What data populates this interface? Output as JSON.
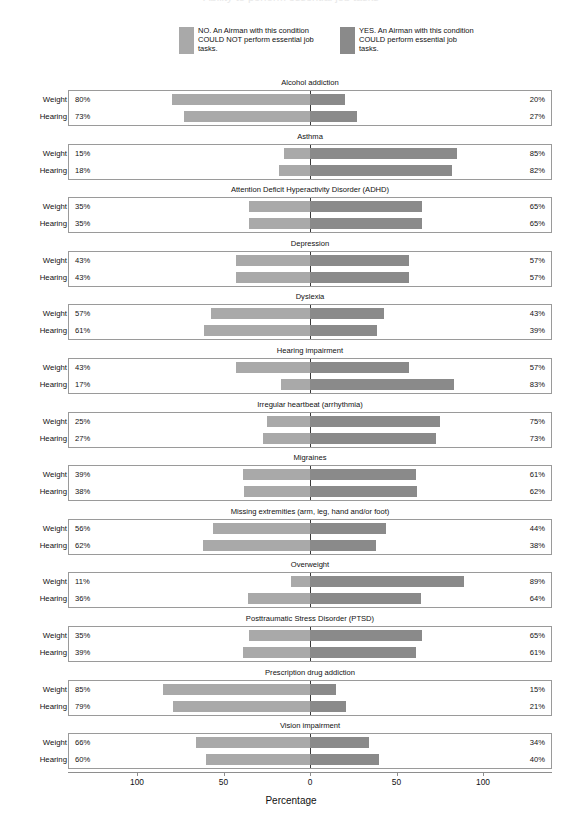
{
  "title_ghost": "Ability to perform essential job tasks",
  "legend": {
    "items": [
      {
        "key": "no",
        "color": "#a9a9a9",
        "label": "NO. An Airman with this condition COULD NOT perform essential job tasks."
      },
      {
        "key": "yes",
        "color": "#8a8a8a",
        "label": "YES. An Airman with this condition COULD perform essential job tasks."
      }
    ]
  },
  "axis": {
    "title": "Percentage",
    "ticks": [
      {
        "value": -100,
        "label": "100"
      },
      {
        "value": -50,
        "label": "50"
      },
      {
        "value": 0,
        "label": "0"
      },
      {
        "value": 50,
        "label": "50"
      },
      {
        "value": 100,
        "label": "100"
      }
    ],
    "xlim": [
      -100,
      100
    ]
  },
  "row_labels": [
    "Weight",
    "Hearing"
  ],
  "chart_data": {
    "type": "bar",
    "subtype": "diverging-stacked-bar",
    "title": "Ability to perform essential job tasks",
    "xlabel": "Percentage",
    "ylabel": "",
    "xlim": [
      -100,
      100
    ],
    "grid": false,
    "legend_position": "top",
    "series": [
      {
        "name": "NO. An Airman with this condition COULD NOT perform essential job tasks.",
        "color": "#a9a9a9",
        "side": "left"
      },
      {
        "name": "YES. An Airman with this condition COULD perform essential job tasks.",
        "color": "#8a8a8a",
        "side": "right"
      }
    ],
    "group_labels": [
      "Weight",
      "Hearing"
    ],
    "categories": [
      "Alcohol addiction",
      "Asthma",
      "Attention Deficit Hyperactivity Disorder (ADHD)",
      "Depression",
      "Dyslexia",
      "Hearing impairment",
      "Irregular heartbeat (arrhythmia)",
      "Migraines",
      "Missing extremities (arm, leg, hand and/or foot)",
      "Overweight",
      "Posttraumatic Stress Disorder (PTSD)",
      "Prescription drug addiction",
      "Vision impairment"
    ],
    "panels": [
      {
        "category": "Alcohol addiction",
        "rows": [
          {
            "group": "Weight",
            "no": 80,
            "yes": 20,
            "no_label": "80%",
            "yes_label": "20%"
          },
          {
            "group": "Hearing",
            "no": 73,
            "yes": 27,
            "no_label": "73%",
            "yes_label": "27%"
          }
        ]
      },
      {
        "category": "Asthma",
        "rows": [
          {
            "group": "Weight",
            "no": 15,
            "yes": 85,
            "no_label": "15%",
            "yes_label": "85%"
          },
          {
            "group": "Hearing",
            "no": 18,
            "yes": 82,
            "no_label": "18%",
            "yes_label": "82%"
          }
        ]
      },
      {
        "category": "Attention Deficit Hyperactivity Disorder (ADHD)",
        "rows": [
          {
            "group": "Weight",
            "no": 35,
            "yes": 65,
            "no_label": "35%",
            "yes_label": "65%"
          },
          {
            "group": "Hearing",
            "no": 35,
            "yes": 65,
            "no_label": "35%",
            "yes_label": "65%"
          }
        ]
      },
      {
        "category": "Depression",
        "rows": [
          {
            "group": "Weight",
            "no": 43,
            "yes": 57,
            "no_label": "43%",
            "yes_label": "57%"
          },
          {
            "group": "Hearing",
            "no": 43,
            "yes": 57,
            "no_label": "43%",
            "yes_label": "57%"
          }
        ]
      },
      {
        "category": "Dyslexia",
        "rows": [
          {
            "group": "Weight",
            "no": 57,
            "yes": 43,
            "no_label": "57%",
            "yes_label": "43%"
          },
          {
            "group": "Hearing",
            "no": 61,
            "yes": 39,
            "no_label": "61%",
            "yes_label": "39%"
          }
        ]
      },
      {
        "category": "Hearing impairment",
        "rows": [
          {
            "group": "Weight",
            "no": 43,
            "yes": 57,
            "no_label": "43%",
            "yes_label": "57%"
          },
          {
            "group": "Hearing",
            "no": 17,
            "yes": 83,
            "no_label": "17%",
            "yes_label": "83%"
          }
        ]
      },
      {
        "category": "Irregular heartbeat (arrhythmia)",
        "rows": [
          {
            "group": "Weight",
            "no": 25,
            "yes": 75,
            "no_label": "25%",
            "yes_label": "75%"
          },
          {
            "group": "Hearing",
            "no": 27,
            "yes": 73,
            "no_label": "27%",
            "yes_label": "73%"
          }
        ]
      },
      {
        "category": "Migraines",
        "rows": [
          {
            "group": "Weight",
            "no": 39,
            "yes": 61,
            "no_label": "39%",
            "yes_label": "61%"
          },
          {
            "group": "Hearing",
            "no": 38,
            "yes": 62,
            "no_label": "38%",
            "yes_label": "62%"
          }
        ]
      },
      {
        "category": "Missing extremities (arm, leg, hand and/or foot)",
        "rows": [
          {
            "group": "Weight",
            "no": 56,
            "yes": 44,
            "no_label": "56%",
            "yes_label": "44%"
          },
          {
            "group": "Hearing",
            "no": 62,
            "yes": 38,
            "no_label": "62%",
            "yes_label": "38%"
          }
        ]
      },
      {
        "category": "Overweight",
        "rows": [
          {
            "group": "Weight",
            "no": 11,
            "yes": 89,
            "no_label": "11%",
            "yes_label": "89%"
          },
          {
            "group": "Hearing",
            "no": 36,
            "yes": 64,
            "no_label": "36%",
            "yes_label": "64%"
          }
        ]
      },
      {
        "category": "Posttraumatic Stress Disorder (PTSD)",
        "rows": [
          {
            "group": "Weight",
            "no": 35,
            "yes": 65,
            "no_label": "35%",
            "yes_label": "65%"
          },
          {
            "group": "Hearing",
            "no": 39,
            "yes": 61,
            "no_label": "39%",
            "yes_label": "61%"
          }
        ]
      },
      {
        "category": "Prescription drug addiction",
        "rows": [
          {
            "group": "Weight",
            "no": 85,
            "yes": 15,
            "no_label": "85%",
            "yes_label": "15%"
          },
          {
            "group": "Hearing",
            "no": 79,
            "yes": 21,
            "no_label": "79%",
            "yes_label": "21%"
          }
        ]
      },
      {
        "category": "Vision impairment",
        "rows": [
          {
            "group": "Weight",
            "no": 66,
            "yes": 34,
            "no_label": "66%",
            "yes_label": "34%"
          },
          {
            "group": "Hearing",
            "no": 60,
            "yes": 40,
            "no_label": "60%",
            "yes_label": "40%"
          }
        ]
      }
    ]
  }
}
